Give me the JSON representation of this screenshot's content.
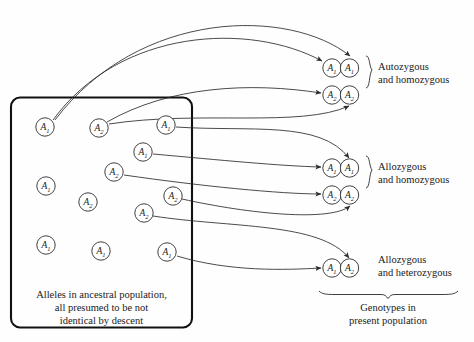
{
  "figure": {
    "ancestral_box": {
      "caption_line1": "Alleles in ancestral population,",
      "caption_line2": "all presumed to be not",
      "caption_line3": "identical by descent",
      "alleles": [
        {
          "id": "a1",
          "base": "A",
          "sub": "1",
          "cx": 45,
          "cy": 127
        },
        {
          "id": "a2",
          "base": "A",
          "sub": "2",
          "cx": 99,
          "cy": 128
        },
        {
          "id": "a3",
          "base": "A",
          "sub": "1",
          "cx": 166,
          "cy": 125
        },
        {
          "id": "a4",
          "base": "A",
          "sub": "1",
          "cx": 143,
          "cy": 152
        },
        {
          "id": "a5",
          "base": "A",
          "sub": "2",
          "cx": 114,
          "cy": 172
        },
        {
          "id": "a6",
          "base": "A",
          "sub": "1",
          "cx": 46,
          "cy": 186
        },
        {
          "id": "a7",
          "base": "A",
          "sub": "2",
          "cx": 173,
          "cy": 196
        },
        {
          "id": "a8",
          "base": "A",
          "sub": "2",
          "cx": 88,
          "cy": 202
        },
        {
          "id": "a9",
          "base": "A",
          "sub": "2",
          "cx": 144,
          "cy": 213
        },
        {
          "id": "a10",
          "base": "A",
          "sub": "1",
          "cx": 46,
          "cy": 245
        },
        {
          "id": "a11",
          "base": "A",
          "sub": "1",
          "cx": 101,
          "cy": 251
        },
        {
          "id": "a12",
          "base": "A",
          "sub": "1",
          "cx": 167,
          "cy": 252
        }
      ]
    },
    "genotypes": [
      {
        "id": "g1",
        "left_base": "A",
        "left_sub": "1",
        "right_base": "A",
        "right_sub": "1",
        "cx_left": 332,
        "cy": 68
      },
      {
        "id": "g2",
        "left_base": "A",
        "left_sub": "2",
        "right_base": "A",
        "right_sub": "2",
        "cx_left": 332,
        "cy": 95
      },
      {
        "id": "g3",
        "left_base": "A",
        "left_sub": "1",
        "right_base": "A",
        "right_sub": "1",
        "cx_left": 332,
        "cy": 168
      },
      {
        "id": "g4",
        "left_base": "A",
        "left_sub": "2",
        "right_base": "A",
        "right_sub": "2",
        "cx_left": 332,
        "cy": 195
      },
      {
        "id": "g5",
        "left_base": "A",
        "left_sub": "1",
        "right_base": "A",
        "right_sub": "2",
        "cx_left": 332,
        "cy": 268
      }
    ],
    "group_labels": [
      {
        "id": "grp1",
        "line1": "Autozygous",
        "line2": "and homozygous",
        "x": 378,
        "y": 70
      },
      {
        "id": "grp2",
        "line1": "Allozygous",
        "line2": "and homozygous",
        "x": 378,
        "y": 170
      },
      {
        "id": "grp3",
        "line1": "Allozygous",
        "line2": "and heterozygous",
        "x": 378,
        "y": 263
      }
    ],
    "bottom_label": {
      "line1": "Genotypes in",
      "line2": "present population"
    }
  },
  "colors": {
    "stroke": "#2b2b2b",
    "box_stroke": "#111111",
    "background": "#fefefe",
    "text": "#1a1a1a"
  }
}
